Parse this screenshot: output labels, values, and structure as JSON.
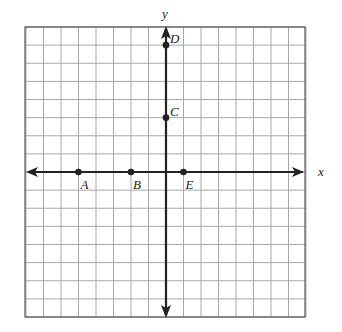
{
  "diagram": {
    "type": "coordinate-grid",
    "axes": {
      "x_label": "x",
      "y_label": "y"
    },
    "grid": {
      "cols": 16,
      "rows": 16,
      "x_min": -8,
      "x_max": 8,
      "y_min": -8,
      "y_max": 8
    },
    "points": [
      {
        "label": "A",
        "x": -5,
        "y": 0
      },
      {
        "label": "B",
        "x": -2,
        "y": 0
      },
      {
        "label": "E",
        "x": 1,
        "y": 0
      },
      {
        "label": "C",
        "x": 0,
        "y": 3
      },
      {
        "label": "D",
        "x": 0,
        "y": 7
      }
    ],
    "colors": {
      "grid": "#a8a8a8",
      "axis": "#222222",
      "border": "#555555",
      "point": "#222222"
    }
  }
}
